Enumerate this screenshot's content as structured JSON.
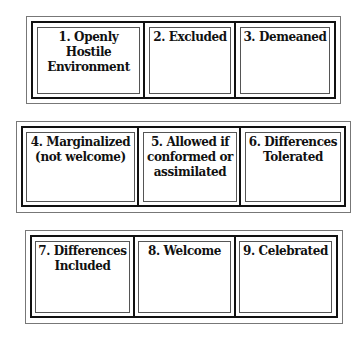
{
  "rows": [
    {
      "cells": [
        {
          "label": "1. Openly\nHostile\nEnvironment"
        },
        {
          "label": "2. Excluded"
        },
        {
          "label": "3. Demeaned"
        }
      ]
    },
    {
      "cells": [
        {
          "label": "4. Marginalized\n(not welcome)"
        },
        {
          "label": "5. Allowed if\nconformed or\nassimilated"
        },
        {
          "label": "6. Differences\nTolerated"
        }
      ]
    },
    {
      "cells": [
        {
          "label": "7. Differences\nIncluded"
        },
        {
          "label": "8. Welcome"
        },
        {
          "label": "9. Celebrated"
        }
      ]
    }
  ]
}
